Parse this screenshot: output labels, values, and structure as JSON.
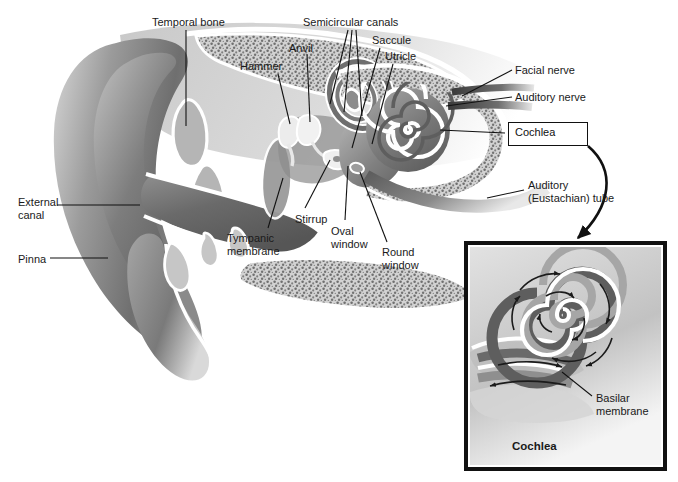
{
  "figure": {
    "background_color": "#ffffff",
    "label_color": "#1a1a1a",
    "line_color": "#111111"
  },
  "main_diagram": {
    "labels": [
      {
        "id": "temporal-bone",
        "text": "Temporal bone",
        "x": 152,
        "y": 16,
        "align": "left"
      },
      {
        "id": "semicircular",
        "text": "Semicircular canals",
        "x": 303,
        "y": 16,
        "align": "left"
      },
      {
        "id": "anvil",
        "text": "Anvil",
        "x": 289,
        "y": 42,
        "align": "left"
      },
      {
        "id": "saccule",
        "text": "Saccule",
        "x": 372,
        "y": 34,
        "align": "left"
      },
      {
        "id": "utricle",
        "text": "Utricle",
        "x": 385,
        "y": 50,
        "align": "left"
      },
      {
        "id": "hammer",
        "text": "Hammer",
        "x": 240,
        "y": 60,
        "align": "left"
      },
      {
        "id": "facial-nerve",
        "text": "Facial nerve",
        "x": 515,
        "y": 64,
        "align": "left"
      },
      {
        "id": "auditory-nerve",
        "text": "Auditory nerve",
        "x": 515,
        "y": 91,
        "align": "left"
      },
      {
        "id": "external-canal",
        "text": "External\ncanal",
        "x": 18,
        "y": 196,
        "align": "left"
      },
      {
        "id": "pinna",
        "text": "Pinna",
        "x": 18,
        "y": 253,
        "align": "left"
      },
      {
        "id": "tympanic-membrane",
        "text": "Tympanic\nmembrane",
        "x": 227,
        "y": 232,
        "align": "left"
      },
      {
        "id": "stirrup",
        "text": "Stirrup",
        "x": 295,
        "y": 213,
        "align": "left"
      },
      {
        "id": "oval-window",
        "text": "Oval\nwindow",
        "x": 331,
        "y": 225,
        "align": "left"
      },
      {
        "id": "round-window",
        "text": "Round\nwindow",
        "x": 382,
        "y": 246,
        "align": "left"
      },
      {
        "id": "eustachian-tube",
        "text": "Auditory\n(Eustachian) tube",
        "x": 528,
        "y": 179,
        "align": "left"
      }
    ],
    "callout_box": {
      "id": "cochlea-callout",
      "text": "Cochlea",
      "x": 508,
      "y": 122,
      "w": 78,
      "h": 24
    }
  },
  "inset": {
    "box": {
      "x": 466,
      "y": 243,
      "w": 199,
      "h": 226
    },
    "caption": "Cochlea",
    "caption_x": 512,
    "caption_y": 440,
    "labels": [
      {
        "id": "basilar-membrane",
        "text": "Basilar\nmembrane",
        "x": 596,
        "y": 392
      }
    ],
    "arrow_note": "curved arrow from cochlea callout box to inset"
  },
  "palette": {
    "ink": "#111111",
    "tissue_dark": "#6e6e6e",
    "tissue_mid": "#8e8e8e",
    "tissue_light": "#b9b9b9",
    "bone_speckle": "#8a8a8a",
    "highlight": "#ffffff",
    "spiral_dark": "#5c5c5c",
    "spiral_mid": "#9a9a9a"
  }
}
